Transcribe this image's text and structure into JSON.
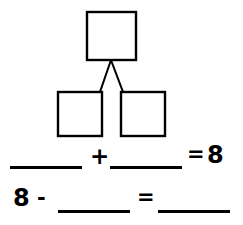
{
  "worksheet": {
    "title": "Number bond with fact family equations",
    "ink_color": "#000000",
    "background_color": "#ffffff"
  },
  "number_bond": {
    "name": "number-bond-diagram",
    "whole_box": {
      "label": "",
      "x": 87,
      "y": 12,
      "width": 49,
      "height": 48
    },
    "part_boxes": [
      {
        "label": "",
        "x": 58,
        "y": 92,
        "width": 44,
        "height": 44
      },
      {
        "label": "",
        "x": 121,
        "y": 92,
        "width": 44,
        "height": 44
      }
    ],
    "connectors": [
      {
        "from_x": 111,
        "from_y": 60,
        "to_x": 100,
        "to_y": 92
      },
      {
        "from_x": 111,
        "from_y": 60,
        "to_x": 123,
        "to_y": 92
      }
    ],
    "stroke_width": 2
  },
  "equations": [
    {
      "name": "addition-equation",
      "addend_1": "",
      "plus": "+",
      "addend_2": "",
      "equals": "=",
      "sum": "8"
    },
    {
      "name": "subtraction-equation",
      "minuend": "8",
      "minus": "-",
      "subtrahend": "",
      "equals": "=",
      "difference": ""
    }
  ]
}
